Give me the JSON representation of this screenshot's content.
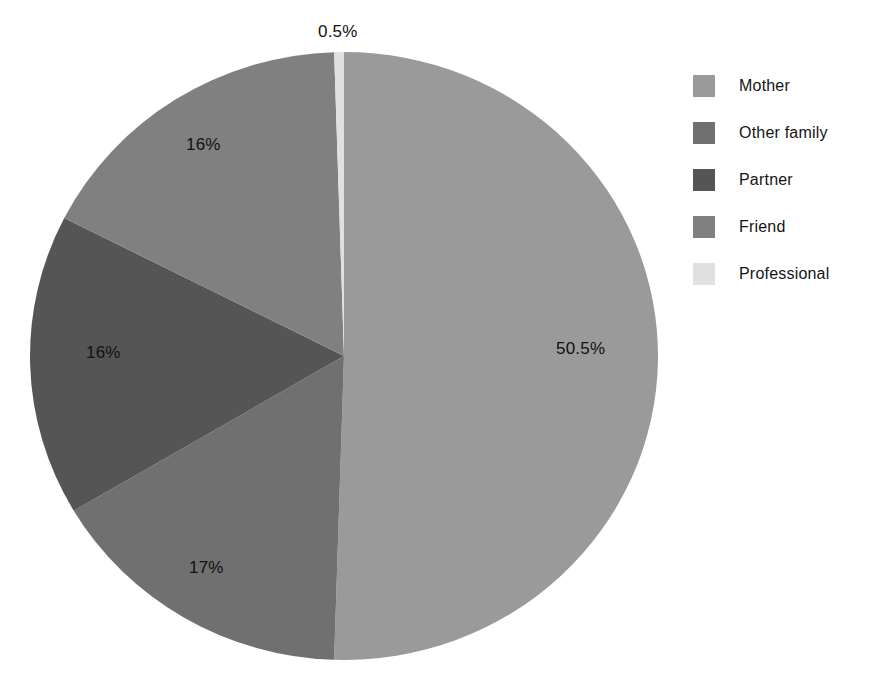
{
  "chart_data": {
    "type": "pie",
    "title": "",
    "subtitle": "",
    "xlabel": "",
    "ylabel": "",
    "grid": false,
    "legend_position": "right",
    "start_angle_deg": 0,
    "direction": "clockwise",
    "categories": [
      "Mother",
      "Other family",
      "Partner",
      "Friend",
      "Professional"
    ],
    "values": [
      50.5,
      16,
      16,
      17,
      0.5
    ],
    "value_unit": "%",
    "labels": [
      "50.5%",
      "16%",
      "16%",
      "17%",
      "0.5%"
    ],
    "colors": [
      "#9a9a9a",
      "#707070",
      "#555555",
      "#808080",
      "#e0e0e0"
    ],
    "slices": [
      {
        "name": "Mother",
        "value": 50.5,
        "label": "50.5%",
        "color": "#9a9a9a"
      },
      {
        "name": "Other family",
        "value": 16,
        "label": "16%",
        "color": "#707070"
      },
      {
        "name": "Partner",
        "value": 16,
        "label": "16%",
        "color": "#555555"
      },
      {
        "name": "Friend",
        "value": 17,
        "label": "17%",
        "color": "#808080"
      },
      {
        "name": "Professional",
        "value": 0.5,
        "label": "0.5%",
        "color": "#e0e0e0"
      }
    ]
  },
  "legend": {
    "items": [
      {
        "label": "Mother",
        "color": "#9a9a9a"
      },
      {
        "label": "Other family",
        "color": "#707070"
      },
      {
        "label": "Partner",
        "color": "#555555"
      },
      {
        "label": "Friend",
        "color": "#808080"
      },
      {
        "label": "Professional",
        "color": "#e0e0e0"
      }
    ]
  },
  "slice_labels": {
    "mother": "50.5%",
    "other_family": "16%",
    "partner": "16%",
    "friend": "17%",
    "professional": "0.5%"
  }
}
